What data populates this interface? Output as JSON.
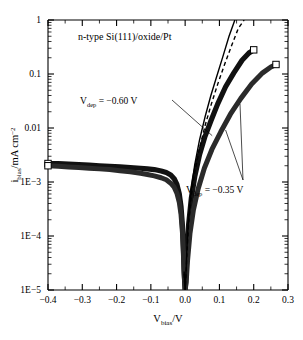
{
  "figure": {
    "title": "n-type Si(111)/oxide/Pt",
    "background_color": "#ffffff",
    "foreground_color": "#000000"
  },
  "chart_data": {
    "type": "line",
    "title": "n-type Si(111)/oxide/Pt",
    "xlabel": "V_bias/V",
    "xlabel_main": "V",
    "xlabel_sub": "bias",
    "xlabel_tail": "/V",
    "ylabel": "i_bias/mA cm^-2",
    "ylabel_main": "i",
    "ylabel_sub": "bias",
    "ylabel_tail": "/mA cm",
    "ylabel_sup": "-2",
    "xlim": [
      -0.4,
      0.3
    ],
    "ylim": [
      1e-05,
      1
    ],
    "yscale": "log",
    "xscale": "linear",
    "grid": false,
    "legend": false,
    "xticks": [
      -0.4,
      -0.3,
      -0.2,
      -0.1,
      0.0,
      0.1,
      0.2,
      0.3
    ],
    "xticklabels": [
      "-0.4",
      "-0.3",
      "-0.2",
      "-0.1",
      "0.0",
      "0.1",
      "0.2",
      "0.3"
    ],
    "yticks": [
      1,
      0.1,
      0.01,
      0.001,
      0.0001,
      1e-05
    ],
    "yticklabels": [
      "1",
      "0.1",
      "0.01",
      "1E-3",
      "1E-4",
      "1E-5"
    ],
    "annotations": [
      {
        "id": "vdep-060",
        "text": "V_dep = -0.60 V",
        "text_main": "V",
        "text_sub": "dep",
        "text_tail": " = −0.60 V",
        "x": -0.255,
        "y": 0.0165,
        "points_to_x": 0.079,
        "points_to_y": 0.0072
      },
      {
        "id": "vdep-035",
        "text": "V_dep = -0.35 V",
        "text_main": "V",
        "text_sub": "dep",
        "text_tail": " = −0.35 V",
        "x": 0.028,
        "y": 0.00086,
        "points_to_x": 0.118,
        "points_to_y": 0.0092
      }
    ],
    "series": [
      {
        "name": "measured-vdep-060",
        "style": "thick-solid-dark",
        "marker": "open-square-endpoint",
        "x": [
          -0.4,
          -0.37,
          -0.34,
          -0.31,
          -0.28,
          -0.25,
          -0.22,
          -0.19,
          -0.16,
          -0.13,
          -0.11,
          -0.09,
          -0.07,
          -0.055,
          -0.042,
          -0.032,
          -0.024,
          -0.017,
          -0.012,
          -0.008,
          -0.005,
          -0.003,
          -0.001,
          0.0,
          0.002,
          0.005,
          0.01,
          0.018,
          0.028,
          0.042,
          0.058,
          0.075,
          0.095,
          0.118,
          0.142,
          0.166,
          0.186,
          0.2
        ],
        "y": [
          0.0022,
          0.0022,
          0.00215,
          0.0021,
          0.00205,
          0.002,
          0.00195,
          0.0019,
          0.00185,
          0.0018,
          0.00175,
          0.0017,
          0.0016,
          0.0015,
          0.00135,
          0.00115,
          0.0009,
          0.0006,
          0.00035,
          0.00016,
          6e-05,
          2.4e-05,
          1.3e-05,
          1e-05,
          1.5e-05,
          4.5e-05,
          0.00016,
          0.0005,
          0.00125,
          0.0032,
          0.007,
          0.0135,
          0.028,
          0.058,
          0.105,
          0.18,
          0.245,
          0.28
        ]
      },
      {
        "name": "measured-vdep-035",
        "style": "thick-solid-dark",
        "marker": "open-square-endpoint",
        "x": [
          -0.4,
          -0.37,
          -0.34,
          -0.31,
          -0.28,
          -0.25,
          -0.22,
          -0.19,
          -0.16,
          -0.13,
          -0.11,
          -0.09,
          -0.07,
          -0.055,
          -0.042,
          -0.032,
          -0.024,
          -0.017,
          -0.012,
          -0.008,
          -0.005,
          -0.003,
          -0.001,
          0.0,
          0.003,
          0.007,
          0.014,
          0.024,
          0.038,
          0.056,
          0.078,
          0.104,
          0.132,
          0.162,
          0.194,
          0.226,
          0.25,
          0.265
        ],
        "y": [
          0.002,
          0.00195,
          0.0019,
          0.00185,
          0.0018,
          0.00175,
          0.0017,
          0.00162,
          0.00155,
          0.00145,
          0.00138,
          0.0013,
          0.0012,
          0.0011,
          0.00095,
          0.0008,
          0.00062,
          0.00042,
          0.00025,
          0.00012,
          4.5e-05,
          2e-05,
          1.2e-05,
          1e-05,
          1.4e-05,
          3.5e-05,
          0.00011,
          0.0003,
          0.00075,
          0.0018,
          0.004,
          0.0085,
          0.018,
          0.035,
          0.065,
          0.105,
          0.135,
          0.15
        ]
      },
      {
        "name": "model-solid",
        "style": "thin-solid",
        "marker": "none",
        "x": [
          -0.003,
          -0.001,
          0.0,
          0.002,
          0.005,
          0.01,
          0.018,
          0.028,
          0.042,
          0.058,
          0.075,
          0.092,
          0.11,
          0.128,
          0.145
        ],
        "y": [
          2.2e-05,
          1.2e-05,
          1e-05,
          1.8e-05,
          5.5e-05,
          0.00022,
          0.00075,
          0.0021,
          0.006,
          0.016,
          0.04,
          0.09,
          0.21,
          0.5,
          1.0
        ]
      },
      {
        "name": "model-dashed",
        "style": "thin-dashed",
        "marker": "none",
        "x": [
          -0.003,
          -0.001,
          0.0,
          0.002,
          0.005,
          0.01,
          0.018,
          0.028,
          0.042,
          0.058,
          0.075,
          0.095,
          0.115,
          0.135,
          0.155,
          0.172
        ],
        "y": [
          2e-05,
          1.2e-05,
          1e-05,
          1.6e-05,
          4.5e-05,
          0.00017,
          0.00055,
          0.0015,
          0.0042,
          0.011,
          0.026,
          0.065,
          0.15,
          0.33,
          0.7,
          1.0
        ]
      }
    ]
  }
}
